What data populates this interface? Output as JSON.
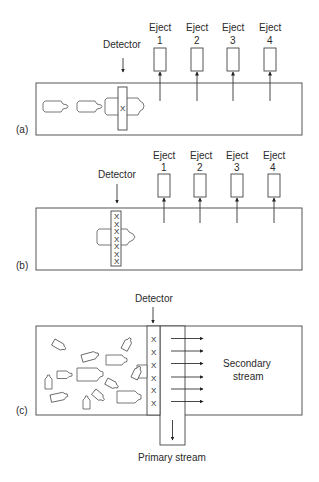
{
  "figure": {
    "panels": [
      {
        "id": "a",
        "label": "(a)",
        "detector_label": "Detector",
        "ejectors": [
          {
            "title": "Eject",
            "number": "1"
          },
          {
            "title": "Eject",
            "number": "2"
          },
          {
            "title": "Eject",
            "number": "3"
          },
          {
            "title": "Eject",
            "number": "4"
          }
        ],
        "detector_marks": [
          "X"
        ]
      },
      {
        "id": "b",
        "label": "(b)",
        "detector_label": "Detector",
        "ejectors": [
          {
            "title": "Eject",
            "number": "1"
          },
          {
            "title": "Eject",
            "number": "2"
          },
          {
            "title": "Eject",
            "number": "3"
          },
          {
            "title": "Eject",
            "number": "4"
          }
        ],
        "detector_marks": [
          "X",
          "X",
          "X",
          "X",
          "X",
          "X",
          "X"
        ]
      },
      {
        "id": "c",
        "label": "(c)",
        "detector_label": "Detector",
        "detector_marks": [
          "X",
          "X",
          "X",
          "X",
          "X",
          "X"
        ],
        "secondary_stream_label": [
          "Secondary",
          "stream"
        ],
        "primary_stream_label": "Primary stream"
      }
    ]
  }
}
